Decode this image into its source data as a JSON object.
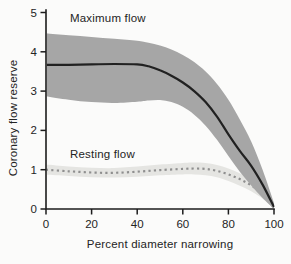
{
  "figure": {
    "background": "#fbfbfa"
  },
  "chart_data": {
    "type": "line",
    "title": "",
    "xlabel": "Percent diameter narrowing",
    "ylabel": "Coronary flow reserve",
    "xlim": [
      0,
      100
    ],
    "ylim": [
      0,
      5
    ],
    "xticks": [
      0,
      20,
      40,
      60,
      80,
      100
    ],
    "yticks": [
      0,
      1,
      2,
      3,
      4,
      5
    ],
    "grid": false,
    "legend_position": "inline-annotations",
    "axis_color": "#1c1c1c",
    "tick_label_color": "#242424",
    "series": [
      {
        "name": "Maximum flow",
        "line_style": "solid",
        "line_color": "#212121",
        "band_color": "#a6a6a6",
        "x": [
          0,
          10,
          20,
          30,
          40,
          45,
          50,
          55,
          60,
          65,
          70,
          75,
          80,
          85,
          90,
          95,
          100
        ],
        "y": [
          3.67,
          3.67,
          3.68,
          3.69,
          3.68,
          3.63,
          3.53,
          3.39,
          3.22,
          3.0,
          2.72,
          2.35,
          1.9,
          1.48,
          1.1,
          0.62,
          0.05
        ],
        "band_upper": [
          4.47,
          4.42,
          4.38,
          4.33,
          4.28,
          4.23,
          4.16,
          4.06,
          3.92,
          3.74,
          3.5,
          3.18,
          2.78,
          2.28,
          1.72,
          1.0,
          0.15
        ],
        "band_lower": [
          2.87,
          2.78,
          2.72,
          2.7,
          2.73,
          2.76,
          2.77,
          2.72,
          2.6,
          2.4,
          2.12,
          1.76,
          1.35,
          0.95,
          0.6,
          0.28,
          0.0
        ]
      },
      {
        "name": "Resting flow",
        "line_style": "dotted",
        "line_color": "#8f8f8f",
        "band_color": "#e5e5e2",
        "x": [
          0,
          10,
          20,
          30,
          40,
          50,
          60,
          65,
          70,
          75,
          80,
          85,
          90,
          95,
          100
        ],
        "y": [
          1.0,
          0.96,
          0.93,
          0.92,
          0.95,
          0.99,
          1.02,
          1.03,
          1.02,
          0.97,
          0.88,
          0.76,
          0.6,
          0.38,
          0.03
        ],
        "band_upper": [
          1.13,
          1.08,
          1.05,
          1.04,
          1.08,
          1.13,
          1.17,
          1.18,
          1.17,
          1.12,
          1.03,
          0.91,
          0.76,
          0.5,
          0.12
        ],
        "band_lower": [
          0.87,
          0.84,
          0.81,
          0.8,
          0.82,
          0.86,
          0.88,
          0.88,
          0.86,
          0.81,
          0.71,
          0.59,
          0.45,
          0.26,
          0.0
        ]
      }
    ],
    "annotations": [
      {
        "text": "Maximum flow",
        "x": 10.5,
        "y": 4.87
      },
      {
        "text": "Resting flow",
        "x": 10.5,
        "y": 1.4
      }
    ]
  }
}
